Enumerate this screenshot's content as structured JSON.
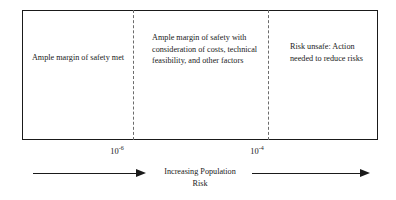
{
  "figure": {
    "bands": [
      {
        "id": "band-ample-margin-met",
        "text": "Ample margin of safety met"
      },
      {
        "id": "band-ample-margin-with-consideration",
        "text": "Ample margin of safety with consideration of costs, technical feasibility, and other factors"
      },
      {
        "id": "band-risk-unsafe",
        "text": "Risk unsafe: Action needed to reduce risks"
      }
    ],
    "thresholds": [
      {
        "id": "threshold-1e-6",
        "base": "10",
        "exponent": "-6"
      },
      {
        "id": "threshold-1e-4",
        "base": "10",
        "exponent": "-4"
      }
    ],
    "axis": {
      "caption_line_1": "Increasing Population",
      "caption_line_2": "Risk",
      "arrow_left_name": "increasing-risk-arrow-left",
      "arrow_right_name": "increasing-risk-arrow-right"
    },
    "colors": {
      "border": "#1a1a1a",
      "divider": "#6b6b6b",
      "text": "#1a1a1a",
      "background": "#ffffff"
    }
  }
}
